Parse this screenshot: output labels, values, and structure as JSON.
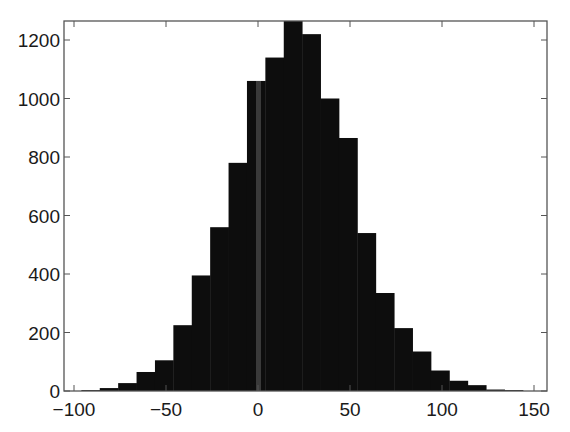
{
  "chart_data": {
    "type": "bar",
    "subtype": "histogram",
    "title": "",
    "xlabel": "",
    "ylabel": "",
    "xlim": [
      -105,
      155
    ],
    "ylim": [
      0,
      1270
    ],
    "grid": false,
    "legend": null,
    "bar_color": "#0d0d0d",
    "bin_width": 10,
    "bin_left_edges": [
      -96,
      -86,
      -76,
      -66,
      -56,
      -46,
      -36,
      -26,
      -16,
      -6,
      4,
      14,
      24,
      34,
      44,
      54,
      64,
      74,
      84,
      94,
      104,
      114,
      124,
      134
    ],
    "values": [
      3,
      10,
      27,
      65,
      105,
      225,
      395,
      560,
      780,
      1060,
      1140,
      1265,
      1220,
      1000,
      865,
      540,
      335,
      215,
      135,
      70,
      35,
      20,
      5,
      3
    ],
    "x_ticks": [
      -100,
      -50,
      0,
      50,
      100,
      150
    ],
    "x_tick_labels": [
      "−100",
      "−50",
      "0",
      "50",
      "100",
      "150"
    ],
    "y_ticks": [
      0,
      200,
      400,
      600,
      800,
      1000,
      1200
    ],
    "y_tick_labels": [
      "0",
      "200",
      "400",
      "600",
      "800",
      "1000",
      "1200"
    ],
    "annotations": [
      "faint gray vertical stripe at x≈0 inside bar"
    ]
  }
}
